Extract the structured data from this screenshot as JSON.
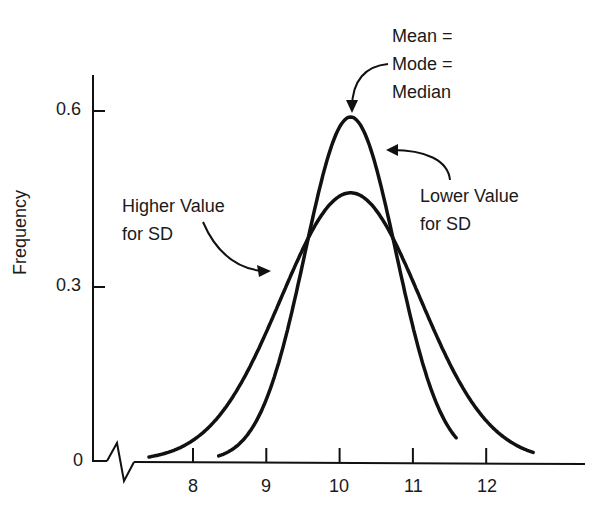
{
  "chart_data": {
    "type": "line",
    "title": "",
    "xlabel": "",
    "ylabel": "Frequency",
    "x_ticks": [
      "8",
      "9",
      "10",
      "11",
      "12"
    ],
    "y_ticks": [
      "0",
      "0.3",
      "0.6"
    ],
    "xlim": [
      7.0,
      13.3
    ],
    "ylim": [
      0,
      0.66
    ],
    "grid": false,
    "axis_break": true,
    "series": [
      {
        "name": "Lower Value for SD",
        "mean": 10.15,
        "sd": 0.62,
        "peak": 0.59,
        "x_range": [
          8.35,
          11.6
        ],
        "color": "#111111"
      },
      {
        "name": "Higher Value for SD",
        "mean": 10.15,
        "sd": 0.95,
        "peak": 0.46,
        "x_range": [
          7.4,
          12.65
        ],
        "color": "#111111"
      }
    ],
    "annotations": [
      {
        "id": "center",
        "lines": [
          "Mean =",
          "Mode =",
          "Median"
        ]
      },
      {
        "id": "lower",
        "lines": [
          "Lower Value",
          "for SD"
        ]
      },
      {
        "id": "higher",
        "lines": [
          "Higher Value",
          "for SD"
        ]
      }
    ]
  }
}
